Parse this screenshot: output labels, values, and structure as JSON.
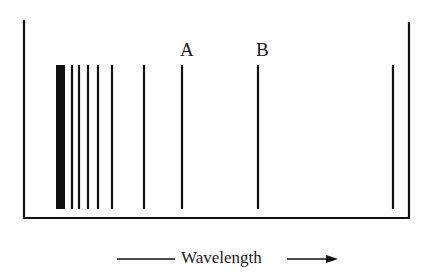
{
  "diagram": {
    "line_color": "#111111",
    "container": {
      "left_x": 24,
      "right_x": 409,
      "top_left_y": 20,
      "top_right_y": 22,
      "bottom_y": 218
    },
    "bars": {
      "top_y": 65,
      "bottom_y": 209,
      "thick_band": {
        "x1": 56,
        "x2": 65
      },
      "lines_x": [
        72,
        79,
        88,
        98,
        112,
        144,
        182,
        258,
        393
      ]
    },
    "labels": [
      {
        "id": "A",
        "text": "A",
        "x": 180,
        "y": 40
      },
      {
        "id": "B",
        "text": "B",
        "x": 256,
        "y": 40
      }
    ],
    "axis": {
      "label": "Wavelength",
      "direction": "increasing-right"
    }
  }
}
